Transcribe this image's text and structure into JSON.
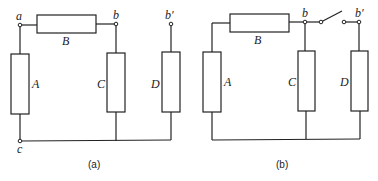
{
  "diagram_a": {
    "caption": "(a)",
    "nodes": {
      "a": "a",
      "b": "b",
      "b_prime": "b′",
      "c": "c"
    },
    "resistors": {
      "A": "A",
      "B": "B",
      "C": "C",
      "D": "D"
    }
  },
  "diagram_b": {
    "caption": "(b)",
    "nodes": {
      "b": "b",
      "b_prime": "b′"
    },
    "resistors": {
      "A": "A",
      "B": "B",
      "C": "C",
      "D": "D"
    },
    "switch": "open"
  },
  "colors": {
    "line": "#222222",
    "background": "#ffffff"
  }
}
